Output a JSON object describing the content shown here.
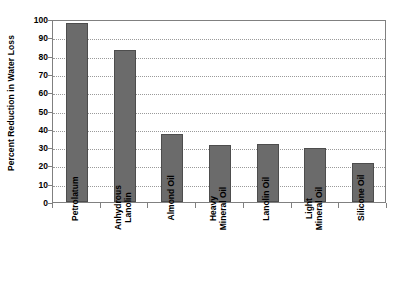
{
  "chart_data": {
    "type": "bar",
    "title": "",
    "subtitle": "",
    "xlabel": "",
    "ylabel": "Percent Reduction in Water Loss",
    "ylim": [
      0,
      100
    ],
    "yticks": [
      0,
      10,
      20,
      30,
      40,
      50,
      60,
      70,
      80,
      90,
      100
    ],
    "ytick_labels": [
      "0",
      "10",
      "20",
      "30",
      "40",
      "50",
      "60",
      "70",
      "80",
      "90",
      "100"
    ],
    "grid": "horizontal-dotted",
    "legend": "none",
    "categories": [
      "Petrolatum",
      "Anhydrous Lanolin",
      "Almond Oil",
      "Heavy Mineral Oil",
      "Lanolin Oil",
      "Light Mineral Oil",
      "Silicone Oil"
    ],
    "category_label_lines": [
      [
        "Petrolatum"
      ],
      [
        "Anhydrous",
        "Lanolin"
      ],
      [
        "Almond Oil"
      ],
      [
        "Heavy",
        "Mineral Oil"
      ],
      [
        "Lanolin Oil"
      ],
      [
        "Light",
        "Mineral Oil"
      ],
      [
        "Silicone Oil"
      ]
    ],
    "values": [
      98,
      83,
      37,
      31,
      31.5,
      29.5,
      21.5
    ],
    "bar_color": "#6b6b6b",
    "bar_border_color": "#4d4d4d",
    "plot_background": "#ffffff",
    "axis_color": "#808080",
    "gridline_color": "#9a9a9a"
  }
}
